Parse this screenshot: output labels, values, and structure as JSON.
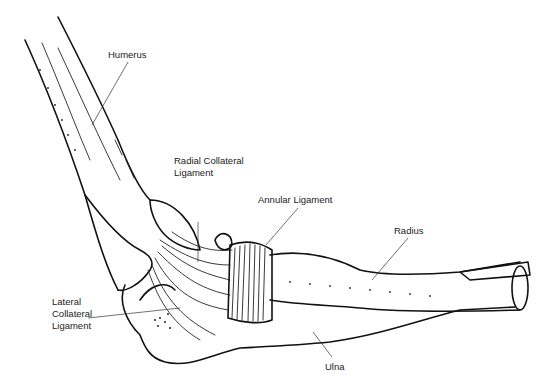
{
  "figure": {
    "type": "anatomical-line-drawing",
    "labels": [
      {
        "id": "humerus",
        "text": "Humerus"
      },
      {
        "id": "radial_collateral_ligament",
        "text": "Radial Collateral\nLigament"
      },
      {
        "id": "annular_ligament",
        "text": "Annular Ligament"
      },
      {
        "id": "radius",
        "text": "Radius"
      },
      {
        "id": "lateral_collateral_ligament",
        "text": "Lateral\nCollateral\nLigament"
      },
      {
        "id": "ulna",
        "text": "Ulna"
      }
    ]
  }
}
